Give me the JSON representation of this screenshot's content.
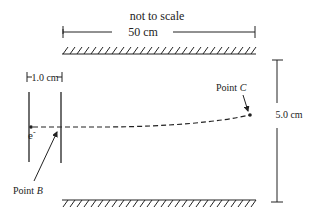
{
  "diagram": {
    "note": "not to scale",
    "length_label": "50 cm",
    "gap_label": "1.0 cm",
    "height_label": "5.0 cm",
    "electron_label": "e",
    "electron_charge": "-",
    "point_b": {
      "prefix": "Point ",
      "letter": "B"
    },
    "point_c": {
      "prefix": "Point ",
      "letter": "C"
    }
  },
  "colors": {
    "ink": "#222222",
    "background": "#ffffff"
  }
}
